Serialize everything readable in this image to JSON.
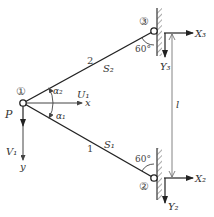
{
  "diagram": {
    "type": "truss-free-body",
    "nodes": [
      {
        "id": "1",
        "label": "①"
      },
      {
        "id": "2",
        "label": "②"
      },
      {
        "id": "3",
        "label": "③"
      }
    ],
    "members": [
      {
        "id": "1",
        "label": "1",
        "force_label": "S₁",
        "from": "1",
        "to": "2"
      },
      {
        "id": "2",
        "label": "2",
        "force_label": "S₂",
        "from": "1",
        "to": "3"
      }
    ],
    "load": {
      "label": "P"
    },
    "axes": {
      "x": "x",
      "y": "y"
    },
    "displacements": {
      "u1": "U₁",
      "v1": "V₁"
    },
    "reactions": {
      "x3": "X₃",
      "y3": "Y₃",
      "x2": "X₂",
      "y2": "Y₂"
    },
    "angles": {
      "alpha1": "α₁",
      "alpha2": "α₂",
      "wall3": "60°",
      "wall2": "60°"
    },
    "dimension": {
      "label": "l"
    }
  }
}
